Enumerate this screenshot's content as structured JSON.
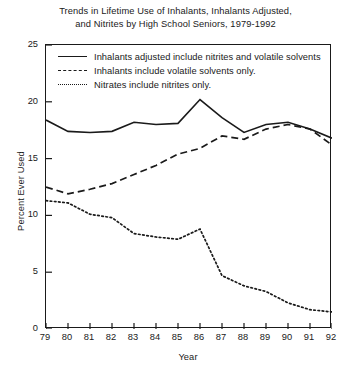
{
  "chart_data": {
    "type": "line",
    "title": "Trends in Lifetime Use of Inhalants, Inhalants Adjusted, and Nitrites by High School Seniors, 1979-1992",
    "title_lines": [
      "Trends in Lifetime Use of Inhalants, Inhalants Adjusted,",
      "and Nitrites by High School Seniors, 1979-1992"
    ],
    "xlabel": "Year",
    "ylabel": "Percent Ever Used",
    "x": [
      79,
      80,
      81,
      82,
      83,
      84,
      85,
      86,
      87,
      88,
      89,
      90,
      91,
      92
    ],
    "categories": [
      "79",
      "80",
      "81",
      "82",
      "83",
      "84",
      "85",
      "86",
      "87",
      "88",
      "89",
      "90",
      "91",
      "92"
    ],
    "xlim": [
      79,
      92
    ],
    "ylim": [
      0,
      25
    ],
    "yticks": [
      0,
      5,
      10,
      15,
      20,
      25
    ],
    "ytick_labels": [
      "0",
      "5",
      "10",
      "15",
      "20",
      "25"
    ],
    "grid": false,
    "legend_position": "top-inside",
    "series": [
      {
        "name": "Inhalants adjusted include nitrites and volatile solvents",
        "style": "solid",
        "color": "#1a1a1a",
        "values": [
          18.4,
          17.4,
          17.3,
          17.4,
          18.2,
          18.0,
          18.1,
          20.2,
          18.6,
          17.3,
          18.0,
          18.2,
          17.6,
          16.8
        ]
      },
      {
        "name": "Inhalants include volatile solvents only.",
        "style": "dashed",
        "color": "#1a1a1a",
        "values": [
          12.5,
          11.9,
          12.3,
          12.8,
          13.6,
          14.4,
          15.4,
          15.9,
          17.0,
          16.7,
          17.6,
          18.0,
          17.6,
          16.2
        ]
      },
      {
        "name": "Nitrates include nitrites only.",
        "style": "dotted",
        "color": "#1a1a1a",
        "values": [
          11.3,
          11.1,
          10.1,
          9.8,
          8.4,
          8.1,
          7.9,
          8.8,
          4.7,
          3.8,
          3.3,
          2.3,
          1.7,
          1.5
        ]
      }
    ]
  },
  "legend": {
    "items": [
      {
        "label": "Inhalants adjusted include nitrites and volatile solvents",
        "style": "solid"
      },
      {
        "label": "Inhalants include volatile solvents only.",
        "style": "dashed"
      },
      {
        "label": "Nitrates include nitrites only.",
        "style": "dotted"
      }
    ]
  }
}
